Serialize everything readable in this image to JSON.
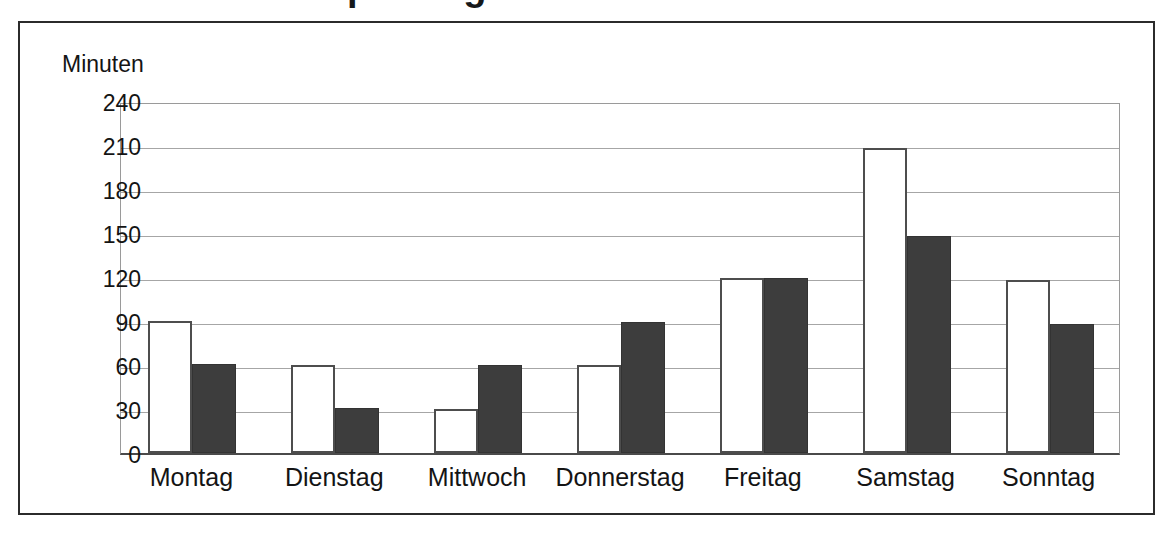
{
  "clipped_title": "Fernsehkonsum pro Tag",
  "figure": {
    "axis_unit_label": "Minuten"
  },
  "chart_data": {
    "type": "bar",
    "title": "",
    "xlabel": "",
    "ylabel": "Minuten",
    "categories": [
      "Montag",
      "Dienstag",
      "Mittwoch",
      "Donnerstag",
      "Freitag",
      "Samstag",
      "Sonntag"
    ],
    "yticks": [
      0,
      30,
      60,
      90,
      120,
      150,
      180,
      210,
      240
    ],
    "ylim": [
      0,
      240
    ],
    "grid": true,
    "legend": "none",
    "series": [
      {
        "name": "series-1",
        "style": "white-filled-outlined",
        "color": "#ffffff",
        "border_color": "#4d4d4d",
        "values": [
          90,
          60,
          30,
          60,
          119,
          208,
          118
        ]
      },
      {
        "name": "series-2",
        "style": "dark-filled",
        "color": "#3d3d3d",
        "border_color": "#333333",
        "values": [
          61,
          31,
          60,
          89,
          119,
          148,
          88
        ]
      }
    ]
  }
}
